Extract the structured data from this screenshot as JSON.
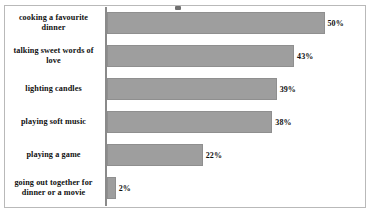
{
  "chart_data": {
    "type": "bar",
    "orientation": "horizontal",
    "title": "",
    "xlabel": "",
    "ylabel": "",
    "xlim": [
      0,
      50
    ],
    "grid": false,
    "legend": false,
    "value_suffix": "%",
    "bar_color": "#9e9e9e",
    "border_color": "#b9b9b9",
    "axis_color": "#8a8a8a",
    "categories": [
      "cooking a favourite dinner",
      "talking sweet words of love",
      "lighting candles",
      "playing soft music",
      "playing a game",
      "going out together for dinner or a movie"
    ],
    "values": [
      50,
      43,
      39,
      38,
      22,
      2
    ],
    "value_labels": [
      "50%",
      "43%",
      "39%",
      "38%",
      "22%",
      "2%"
    ]
  }
}
